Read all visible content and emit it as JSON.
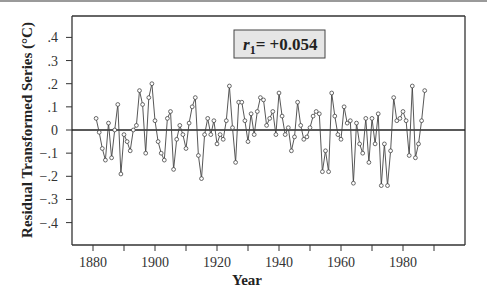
{
  "chart_data": {
    "type": "line",
    "title": "",
    "xlabel": "Year",
    "ylabel": "Residual Transformed Series (°C)",
    "xlim": [
      1873,
      1995
    ],
    "ylim": [
      -0.5,
      0.5
    ],
    "x_ticks": [
      1880,
      1890,
      1900,
      1910,
      1920,
      1930,
      1940,
      1950,
      1960,
      1970,
      1980,
      1990
    ],
    "x_tick_labels": [
      "1880",
      "1900",
      "1920",
      "1940",
      "1960",
      "1980"
    ],
    "y_ticks": [
      0.4,
      0.3,
      0.2,
      0.1,
      0,
      -0.1,
      -0.2,
      -0.3,
      -0.4
    ],
    "y_tick_labels": [
      ".4",
      ".3",
      ".2",
      ".1",
      "0",
      "-.1",
      "-.2",
      "-.3",
      "-.4"
    ],
    "grid": false,
    "reference_line": 0,
    "marker": "open-circle",
    "annotation": {
      "text_var": "r",
      "text_sub": "1",
      "text_rest": "= +0.054"
    },
    "x": [
      1881,
      1882,
      1883,
      1884,
      1885,
      1886,
      1887,
      1888,
      1889,
      1890,
      1891,
      1892,
      1893,
      1894,
      1895,
      1896,
      1897,
      1898,
      1899,
      1900,
      1901,
      1902,
      1903,
      1904,
      1905,
      1906,
      1907,
      1908,
      1909,
      1910,
      1911,
      1912,
      1913,
      1914,
      1915,
      1916,
      1917,
      1918,
      1919,
      1920,
      1921,
      1922,
      1923,
      1924,
      1925,
      1926,
      1927,
      1928,
      1929,
      1930,
      1931,
      1932,
      1933,
      1934,
      1935,
      1936,
      1937,
      1938,
      1939,
      1940,
      1941,
      1942,
      1943,
      1944,
      1945,
      1946,
      1947,
      1948,
      1949,
      1950,
      1951,
      1952,
      1953,
      1954,
      1955,
      1956,
      1957,
      1958,
      1959,
      1960,
      1961,
      1962,
      1963,
      1964,
      1965,
      1966,
      1967,
      1968,
      1969,
      1970,
      1971,
      1972,
      1973,
      1974,
      1975,
      1976,
      1977,
      1978,
      1979,
      1980,
      1981,
      1982,
      1983,
      1984,
      1985,
      1986,
      1987
    ],
    "values": [
      0.05,
      -0.01,
      -0.08,
      -0.13,
      0.03,
      -0.12,
      0.0,
      0.11,
      -0.19,
      -0.02,
      -0.05,
      -0.09,
      0.0,
      0.02,
      0.17,
      0.11,
      -0.1,
      0.14,
      0.2,
      0.04,
      -0.05,
      -0.1,
      -0.13,
      0.05,
      0.08,
      -0.17,
      -0.04,
      0.02,
      -0.02,
      -0.08,
      0.03,
      0.1,
      0.14,
      -0.11,
      -0.21,
      -0.02,
      0.05,
      -0.02,
      0.04,
      -0.06,
      -0.02,
      -0.04,
      0.04,
      0.19,
      0.01,
      -0.14,
      0.12,
      0.12,
      0.04,
      -0.05,
      0.07,
      -0.02,
      0.08,
      0.14,
      0.13,
      0.02,
      0.05,
      0.08,
      -0.02,
      0.16,
      0.06,
      -0.02,
      0.01,
      -0.09,
      -0.03,
      0.12,
      0.02,
      -0.04,
      -0.03,
      0.01,
      0.06,
      0.08,
      0.07,
      -0.18,
      -0.09,
      -0.18,
      0.16,
      0.06,
      -0.02,
      -0.04,
      0.1,
      0.03,
      0.04,
      -0.23,
      0.03,
      -0.06,
      -0.1,
      0.05,
      -0.14,
      0.05,
      -0.06,
      0.07,
      -0.24,
      -0.06,
      -0.24,
      -0.09,
      0.14,
      0.04,
      0.05,
      0.08,
      0.04,
      -0.11,
      0.19,
      -0.12,
      -0.06,
      0.04,
      0.17
    ]
  }
}
